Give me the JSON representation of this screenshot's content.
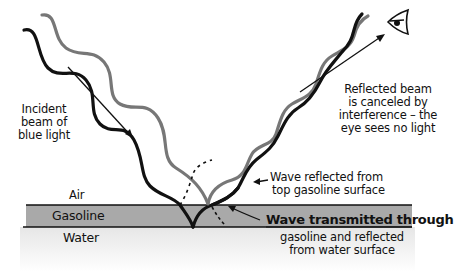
{
  "diagram": {
    "labels": {
      "incident_beam": [
        "Incident",
        "beam of",
        "blue light"
      ],
      "reflected_beam": [
        "Reflected beam",
        "is canceled by",
        "interference – the",
        "eye sees no light"
      ],
      "air": "Air",
      "gasoline": "Gasoline",
      "water": "Water",
      "wave_reflected_top": [
        "Wave reflected from",
        "top gasoline surface"
      ],
      "wave_transmitted": [
        "Wave transmitted through",
        "gasoline and reflected",
        "from water surface"
      ]
    },
    "icons": {
      "eye": "eye-icon",
      "incident_arrow": "arrow-down-right-icon",
      "reflected_arrow": "arrow-up-right-icon"
    },
    "colors": {
      "black_wave": "#111111",
      "gray_wave": "#777777",
      "gasoline_layer": "#aaaaaa",
      "water_layer": "#eeeeee",
      "lines": "#111111"
    }
  }
}
